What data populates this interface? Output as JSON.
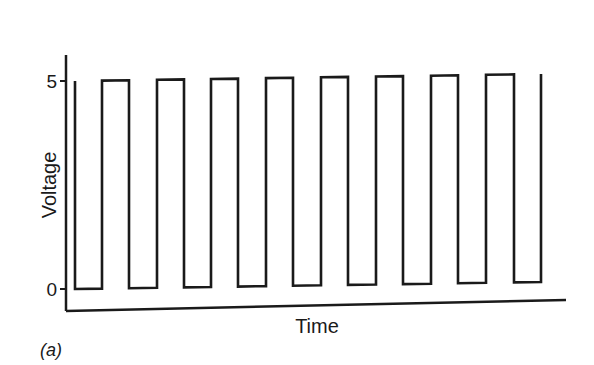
{
  "chart_data": {
    "type": "line",
    "title": "",
    "panel_label": "(a)",
    "xlabel": "Time",
    "ylabel": "Voltage",
    "yticks": [
      "0",
      "5"
    ],
    "ylim": [
      0,
      5
    ],
    "grid": false,
    "legend": null,
    "x": [
      0,
      0,
      1,
      1,
      2,
      2,
      3,
      3,
      4,
      4,
      5,
      5,
      6,
      6,
      7,
      7,
      8,
      8,
      9,
      9,
      10,
      10,
      11,
      11,
      12,
      12,
      13,
      13,
      14,
      14,
      15,
      15,
      16,
      16,
      17,
      17,
      18,
      18
    ],
    "values": [
      5,
      0,
      0,
      5,
      5,
      0,
      0,
      5,
      5,
      0,
      0,
      5,
      5,
      0,
      0,
      5,
      5,
      0,
      0,
      5,
      5,
      0,
      0,
      5,
      5,
      0,
      0,
      5,
      5,
      0,
      0,
      5,
      5,
      0,
      0,
      5,
      5,
      5
    ],
    "series": [
      {
        "name": "Voltage",
        "color": "#1a1a1a"
      }
    ]
  },
  "render": {
    "edges_px": [
      75,
      102,
      129,
      157,
      184,
      211,
      238,
      266,
      293,
      321,
      348,
      376,
      403,
      431,
      458,
      486,
      514,
      541
    ],
    "high_y_start": 81,
    "high_y_end": 74,
    "low_y_start": 289,
    "low_y_end": 282,
    "start_x": 75,
    "end_x": 541,
    "axis": {
      "x0": 66,
      "y_top": 55,
      "y_bottom": 311,
      "x_end": 566,
      "y_end": 300
    },
    "tick5_y": 81,
    "tick0_y": 289
  }
}
